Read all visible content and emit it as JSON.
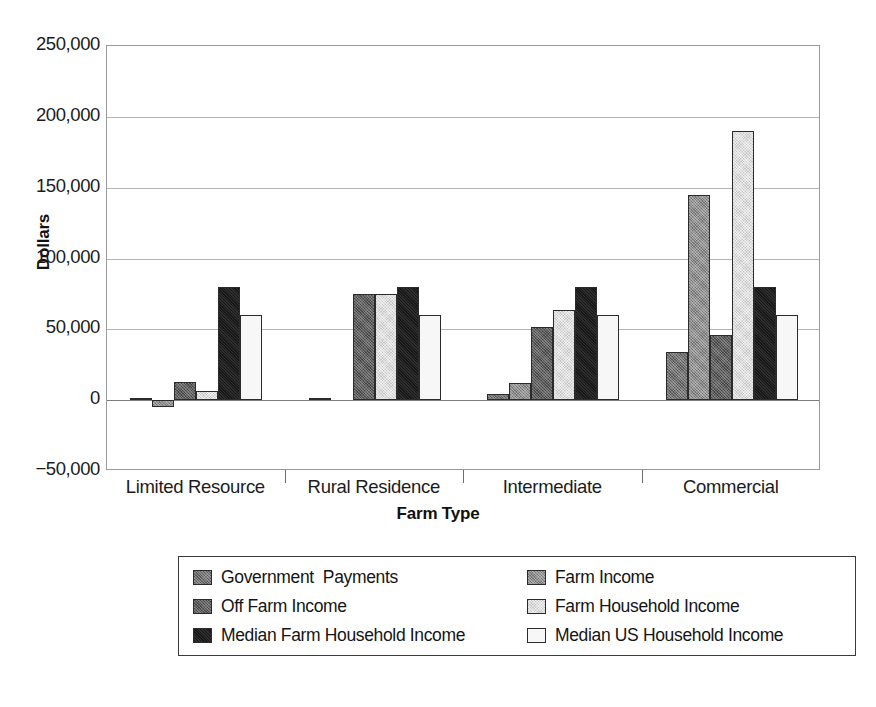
{
  "chart_data": {
    "type": "bar",
    "title": "",
    "subtitle": "",
    "xlabel": "Farm Type",
    "ylabel": "Dollars",
    "categories": [
      "Limited Resource",
      "Rural Residence",
      "Intermediate",
      "Commercial"
    ],
    "ylim": [
      -50000,
      250000
    ],
    "y_ticks": [
      -50000,
      0,
      50000,
      100000,
      150000,
      200000,
      250000
    ],
    "y_tick_labels": [
      "−50,000",
      "0",
      "50,000",
      "100,000",
      "150,000",
      "200,000",
      "250,000"
    ],
    "grid": true,
    "grid_axis": "y",
    "legend_position": "bottom",
    "series": [
      {
        "name": "Government  Payments",
        "key": "gov",
        "color": "#6f6f6f",
        "values": [
          1500,
          1500,
          4500,
          34000
        ]
      },
      {
        "name": "Farm Income",
        "key": "farminc",
        "color": "#8e8e8e",
        "values": [
          -5000,
          0,
          12000,
          145000
        ]
      },
      {
        "name": "Off Farm Income",
        "key": "offfarm",
        "color": "#5d5d5d",
        "values": [
          12500,
          75000,
          52000,
          46000
        ]
      },
      {
        "name": "Farm Household Income",
        "key": "household",
        "color": "#dedede",
        "values": [
          6500,
          75000,
          64000,
          190000
        ]
      },
      {
        "name": "Median Farm Household Income",
        "key": "medfarm",
        "color": "#171717",
        "values": [
          80000,
          80000,
          80000,
          80000
        ]
      },
      {
        "name": "Median US Household Income",
        "key": "medus",
        "color": "#f7f7f7",
        "values": [
          60000,
          60000,
          60000,
          60000
        ]
      }
    ]
  },
  "legend": {
    "columns": [
      [
        "Government  Payments",
        "Off Farm Income",
        "Median Farm Household Income"
      ],
      [
        "Farm Income",
        "Farm Household Income",
        "Median US Household Income"
      ]
    ],
    "column_keys": [
      [
        "gov",
        "offfarm",
        "medfarm"
      ],
      [
        "farminc",
        "household",
        "medus"
      ]
    ]
  },
  "colors": {
    "axis": "#9a9a9a",
    "gridline": "#b4b4b4",
    "text": "#1c1c1c",
    "bar_outline": "#2b2b2b",
    "background": "#ffffff"
  }
}
